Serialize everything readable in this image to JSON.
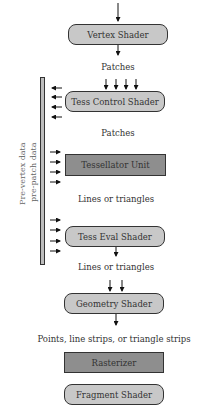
{
  "diagram": {
    "title": "",
    "stages": [
      {
        "id": "vertex",
        "label": "Vertex Shader",
        "shape": "rounded",
        "fill": "#c8c8c8"
      },
      {
        "id": "tess_control",
        "label": "Tess Control Shader",
        "shape": "rounded",
        "fill": "#c8c8c8"
      },
      {
        "id": "tessellator",
        "label": "Tessellator Unit",
        "shape": "rect",
        "fill": "#8e8e8e"
      },
      {
        "id": "tess_eval",
        "label": "Tess Eval Shader",
        "shape": "rounded",
        "fill": "#c8c8c8"
      },
      {
        "id": "geometry",
        "label": "Geometry Shader",
        "shape": "rounded",
        "fill": "#c8c8c8"
      },
      {
        "id": "rasterizer",
        "label": "Rasterizer",
        "shape": "rect",
        "fill": "#8e8e8e"
      },
      {
        "id": "fragment",
        "label": "Fragment Shader",
        "shape": "rounded",
        "fill": "#c8c8c8"
      }
    ],
    "edge_labels": [
      "Patches",
      "Patches",
      "Lines or triangles",
      "Lines or triangles",
      "Points, line strips, or triangle strips"
    ],
    "side_store": {
      "line1": "Pre-vertex data",
      "line2": "pre-patch data"
    },
    "colors": {
      "programmable": "#c8c8c8",
      "fixed_function": "#8e8e8e",
      "stroke": "#333333",
      "store": "#bdbdbd"
    }
  }
}
